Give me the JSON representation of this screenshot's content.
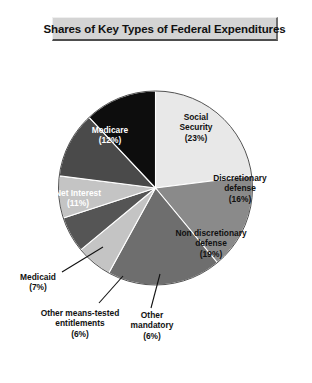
{
  "figure": {
    "title": "Shares of Key Types of Federal Expenditures",
    "background": "#ffffff"
  },
  "chart_data": {
    "type": "pie",
    "title": "Shares of Key Types of Federal Expenditures",
    "xlabel": "",
    "ylabel": "",
    "units": "percent",
    "total": 100,
    "start_angle_deg": 0,
    "direction": "clockwise",
    "legend": "none",
    "grid": false,
    "categories": [
      "Social Security",
      "Discretionary defense",
      "Non discretionary defense",
      "Other mandatory",
      "Other means-tested entitlements",
      "Medicaid",
      "Net Interest",
      "Medicare"
    ],
    "values": [
      23,
      16,
      19,
      6,
      6,
      7,
      11,
      12
    ],
    "colors": [
      "#e8e8e8",
      "#8a8a8a",
      "#6e6e6e",
      "#c4c4c4",
      "#555555",
      "#c4c4c4",
      "#4a4a4a",
      "#0d0d0d"
    ],
    "slices": [
      {
        "name": "Social Security",
        "value": 23,
        "label_line1": "Social",
        "label_line2": "Security",
        "pct_label": "(23%)",
        "color": "#e8e8e8",
        "text_color": "#111111",
        "label_placement": "inside",
        "leader_line": false
      },
      {
        "name": "Discretionary defense",
        "value": 16,
        "label_line1": "Discretionary",
        "label_line2": "defense",
        "pct_label": "(16%)",
        "color": "#8a8a8a",
        "text_color": "#111111",
        "label_placement": "inside",
        "leader_line": false
      },
      {
        "name": "Non discretionary defense",
        "value": 19,
        "label_line1": "Non discretionary",
        "label_line2": "defense",
        "pct_label": "(19%)",
        "color": "#6e6e6e",
        "text_color": "#111111",
        "label_placement": "inside",
        "leader_line": false
      },
      {
        "name": "Other mandatory",
        "value": 6,
        "label_line1": "Other",
        "label_line2": "mandatory",
        "pct_label": "(6%)",
        "color": "#c4c4c4",
        "text_color": "#111111",
        "label_placement": "outside",
        "leader_line": true
      },
      {
        "name": "Other means-tested entitlements",
        "value": 6,
        "label_line1": "Other means-tested",
        "label_line2": "entitlements",
        "pct_label": "(6%)",
        "color": "#555555",
        "text_color": "#111111",
        "label_placement": "outside",
        "leader_line": true
      },
      {
        "name": "Medicaid",
        "value": 7,
        "label_line1": "Medicaid",
        "label_line2": "",
        "pct_label": "(7%)",
        "color": "#c4c4c4",
        "text_color": "#111111",
        "label_placement": "outside",
        "leader_line": true
      },
      {
        "name": "Net Interest",
        "value": 11,
        "label_line1": "Net Interest",
        "label_line2": "",
        "pct_label": "(11%)",
        "color": "#4a4a4a",
        "text_color": "#ffffff",
        "label_placement": "inside",
        "leader_line": false
      },
      {
        "name": "Medicare",
        "value": 12,
        "label_line1": "Medicare",
        "label_line2": "",
        "pct_label": "(12%)",
        "color": "#0d0d0d",
        "text_color": "#ffffff",
        "label_placement": "inside",
        "leader_line": false
      }
    ]
  }
}
